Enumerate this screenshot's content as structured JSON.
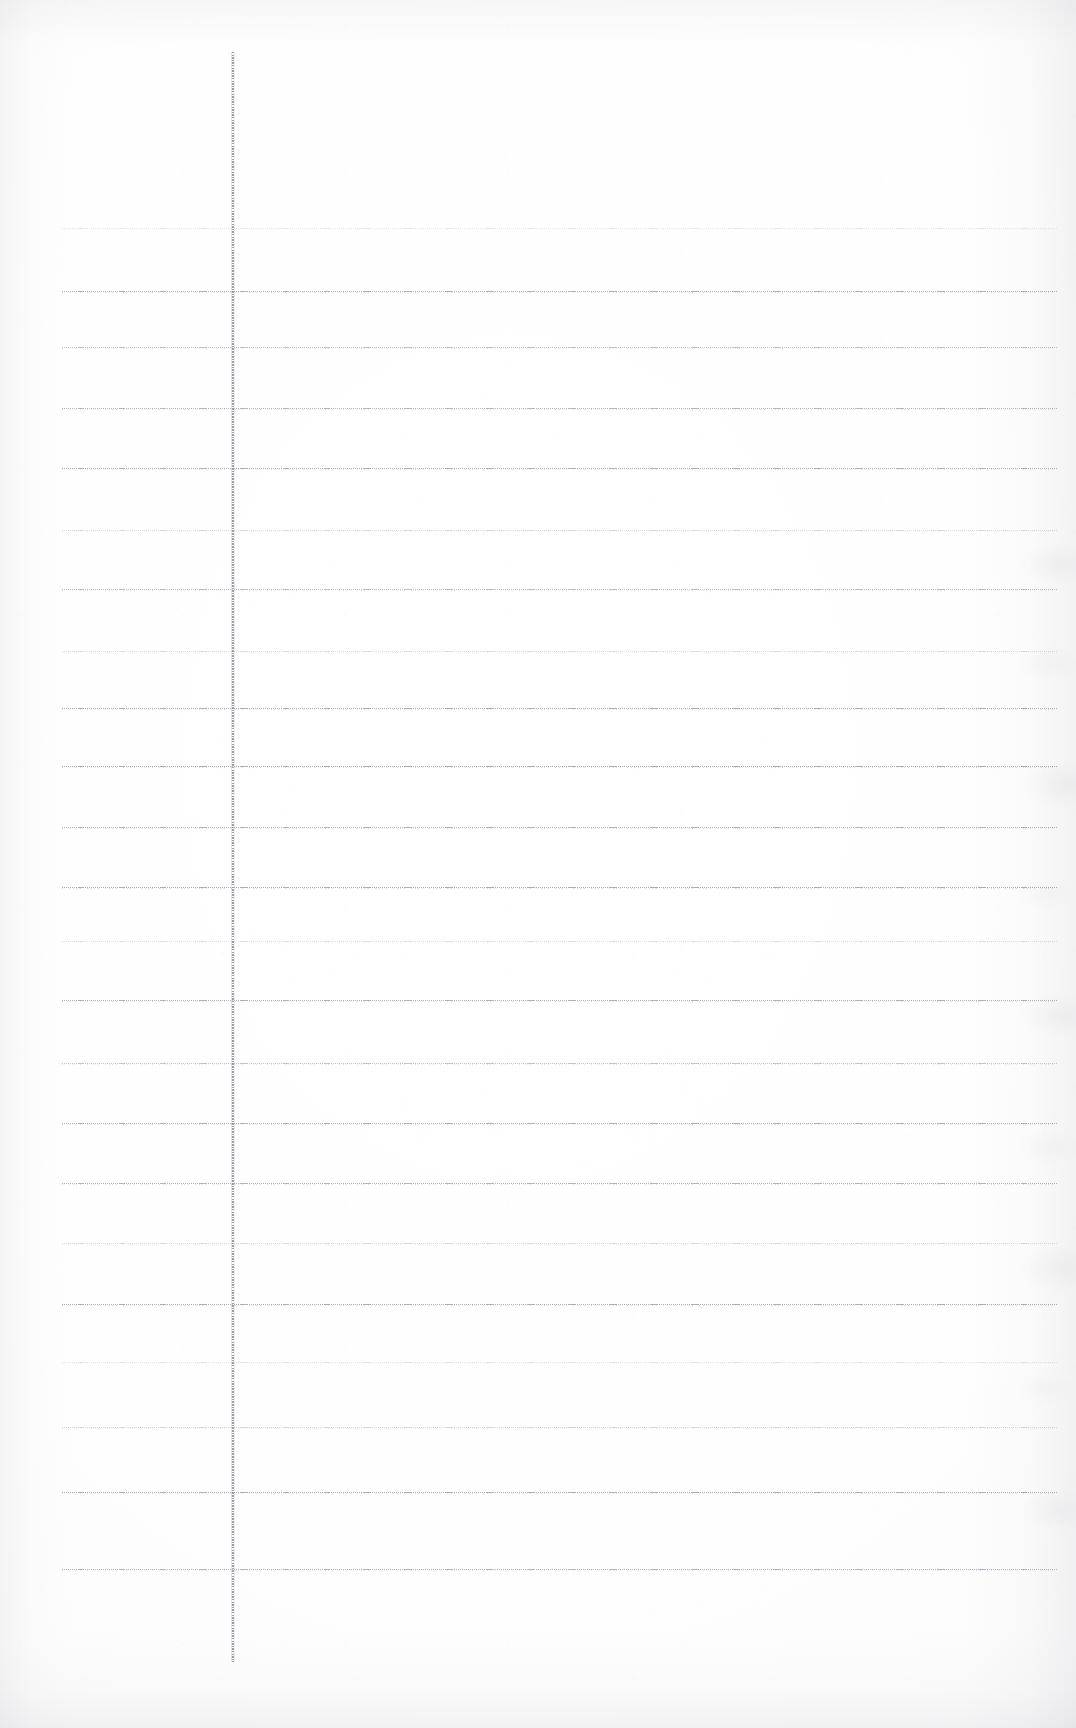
{
  "document": {
    "kind": "scanned-lined-notebook-page",
    "title": "Blank ruled notebook page (scan)",
    "page_width": 1076,
    "page_height": 1728,
    "visible_text": "",
    "handwriting_present": false,
    "background_color": "#ffffff",
    "paper_tone": "#fdfdfe"
  },
  "margin_rule": {
    "name": "vertical margin line",
    "orientation": "vertical",
    "x": 232,
    "y_start": 52,
    "y_end": 1662,
    "color": "#8a8d95",
    "style": "solid-stippled",
    "width_px": 2
  },
  "ruling": {
    "orientation": "horizontal",
    "style": "dotted-faint",
    "spacing_px": 64,
    "left_x": 62,
    "right_x": 1058,
    "count": 21,
    "color_default": "#b9bcc4",
    "lines": [
      {
        "index": 1,
        "y": 228,
        "left_x": 62,
        "right_x": 1058,
        "color": "#d2d5db",
        "opacity": 0.55
      },
      {
        "index": 2,
        "y": 291,
        "left_x": 62,
        "right_x": 1058,
        "color": "#a9adb6",
        "opacity": 0.95
      },
      {
        "index": 3,
        "y": 347,
        "left_x": 62,
        "right_x": 1058,
        "color": "#b2b6be",
        "opacity": 0.85
      },
      {
        "index": 4,
        "y": 408,
        "left_x": 62,
        "right_x": 1058,
        "color": "#adb1ba",
        "opacity": 0.92
      },
      {
        "index": 5,
        "y": 468,
        "left_x": 62,
        "right_x": 1058,
        "color": "#aaaeb7",
        "opacity": 0.94
      },
      {
        "index": 6,
        "y": 530,
        "left_x": 62,
        "right_x": 1058,
        "color": "#c2c5cb",
        "opacity": 0.62
      },
      {
        "index": 7,
        "y": 589,
        "left_x": 62,
        "right_x": 1058,
        "color": "#b0b4bd",
        "opacity": 0.88
      },
      {
        "index": 8,
        "y": 651,
        "left_x": 62,
        "right_x": 1058,
        "color": "#c4c7cd",
        "opacity": 0.6
      },
      {
        "index": 9,
        "y": 708,
        "left_x": 62,
        "right_x": 1058,
        "color": "#a8acb5",
        "opacity": 0.96
      },
      {
        "index": 10,
        "y": 766,
        "left_x": 62,
        "right_x": 1058,
        "color": "#a6aab3",
        "opacity": 0.98
      },
      {
        "index": 11,
        "y": 827,
        "left_x": 62,
        "right_x": 1058,
        "color": "#abafb8",
        "opacity": 0.93
      },
      {
        "index": 12,
        "y": 887,
        "left_x": 62,
        "right_x": 1058,
        "color": "#a7abb4",
        "opacity": 0.97
      },
      {
        "index": 13,
        "y": 941,
        "left_x": 62,
        "right_x": 1058,
        "color": "#c6c9cf",
        "opacity": 0.58
      },
      {
        "index": 14,
        "y": 1000,
        "left_x": 62,
        "right_x": 1058,
        "color": "#aaaeb7",
        "opacity": 0.94
      },
      {
        "index": 15,
        "y": 1063,
        "left_x": 62,
        "right_x": 1058,
        "color": "#b4b8c0",
        "opacity": 0.82
      },
      {
        "index": 16,
        "y": 1123,
        "left_x": 62,
        "right_x": 1058,
        "color": "#a9adb6",
        "opacity": 0.95
      },
      {
        "index": 17,
        "y": 1183,
        "left_x": 62,
        "right_x": 1058,
        "color": "#abafb8",
        "opacity": 0.93
      },
      {
        "index": 18,
        "y": 1243,
        "left_x": 62,
        "right_x": 1058,
        "color": "#c3c6cc",
        "opacity": 0.62
      },
      {
        "index": 19,
        "y": 1304,
        "left_x": 62,
        "right_x": 1058,
        "color": "#a8acb5",
        "opacity": 0.96
      },
      {
        "index": 20,
        "y": 1362,
        "left_x": 62,
        "right_x": 1058,
        "color": "#cacdd3",
        "opacity": 0.52
      },
      {
        "index": 21,
        "y": 1427,
        "left_x": 62,
        "right_x": 1058,
        "color": "#c0c3ca",
        "opacity": 0.66
      },
      {
        "index": 22,
        "y": 1492,
        "left_x": 62,
        "right_x": 1058,
        "color": "#a9adb6",
        "opacity": 0.95
      },
      {
        "index": 23,
        "y": 1569,
        "left_x": 62,
        "right_x": 1058,
        "color": "#acb0b9",
        "opacity": 0.92
      }
    ]
  },
  "artifacts": {
    "left_edge_shadow": true,
    "right_edge_shadow": true,
    "top_edge_shadow": true,
    "bottom_edge_shadow": true,
    "right_edge_crinkle": true,
    "paper_texture": true
  }
}
